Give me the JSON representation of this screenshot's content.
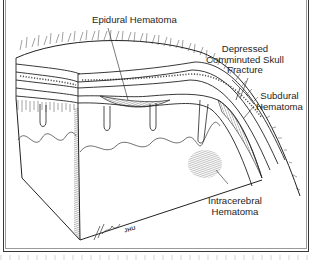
{
  "figure": {
    "type": "medical-illustration",
    "labels": {
      "epidural": "Epidural Hematoma",
      "depressed_line1": "Depressed",
      "depressed_line2": "Comminuted Skull",
      "depressed_line3": "Fracture",
      "subdural_line1": "Subdural",
      "subdural_line2": "Hematoma",
      "intracerebral_line1": "Intracerebral",
      "intracerebral_line2": "Hematoma"
    },
    "signature": "JHU",
    "colors": {
      "ink": "#1e1e1e",
      "frame": "#3a3a3a",
      "background": "#ffffff"
    }
  }
}
